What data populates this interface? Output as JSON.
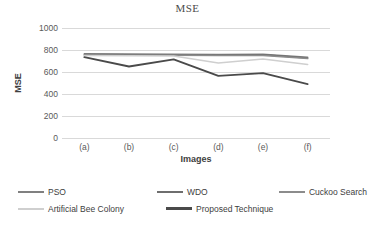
{
  "chart_data": {
    "type": "line",
    "title": "MSE",
    "xlabel": "Images",
    "ylabel": "MSE",
    "categories": [
      "(a)",
      "(b)",
      "(c)",
      "(d)",
      "(e)",
      "(f)"
    ],
    "ylim": [
      0,
      1000
    ],
    "yticks": [
      1000,
      800,
      600,
      400,
      200,
      0
    ],
    "grid": true,
    "legend_position": "bottom",
    "series": [
      {
        "name": "PSO",
        "color": "#808080",
        "values": [
          765,
          763,
          762,
          760,
          762,
          735
        ]
      },
      {
        "name": "WDO",
        "color": "#6e6e6e",
        "values": [
          758,
          757,
          757,
          755,
          757,
          728
        ]
      },
      {
        "name": "Cuckoo Search",
        "color": "#8c8c8c",
        "values": [
          752,
          752,
          753,
          750,
          750,
          722
        ]
      },
      {
        "name": "Artificial Bee Colony",
        "color": "#cfcfcf",
        "values": [
          750,
          748,
          745,
          682,
          718,
          668
        ]
      },
      {
        "name": "Proposed Technique",
        "color": "#4a4a4a",
        "values": [
          735,
          650,
          715,
          565,
          590,
          490
        ]
      }
    ]
  },
  "legend": {
    "rows": [
      [
        "PSO",
        "WDO",
        "Cuckoo Search"
      ],
      [
        "Artificial Bee Colony",
        "Proposed Technique"
      ]
    ]
  }
}
